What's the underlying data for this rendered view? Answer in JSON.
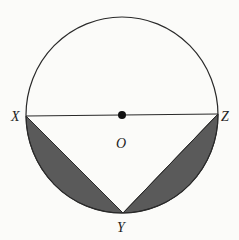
{
  "diagram": {
    "type": "geometry",
    "labels": {
      "X": "X",
      "Z": "Z",
      "O": "O",
      "Y": "Y"
    },
    "colors": {
      "stroke": "#2a2a2a",
      "shaded": "#5a5a5a",
      "background": "#fbfbf9"
    }
  }
}
